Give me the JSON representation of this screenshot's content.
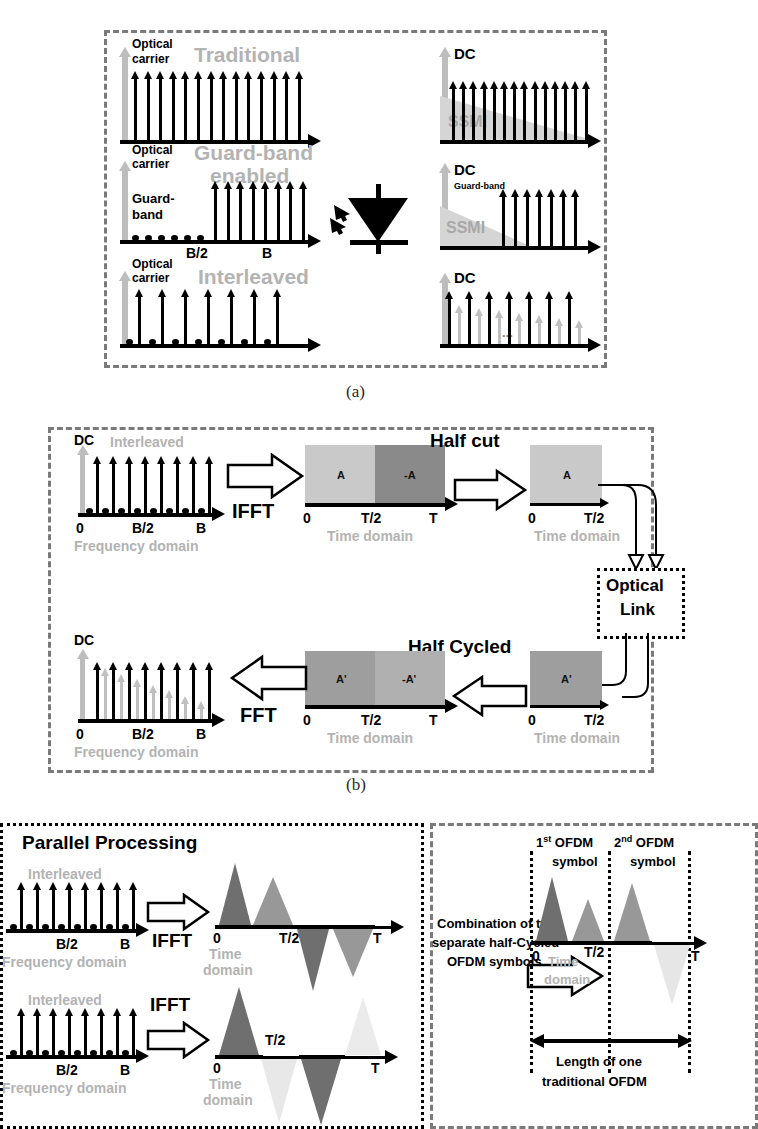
{
  "figure": {
    "captions": {
      "a": "(a)",
      "b": "(b)"
    }
  },
  "panel_a": {
    "rows": [
      {
        "title": "Traditional",
        "left": {
          "carrier_label_line1": "Optical",
          "carrier_label_line2": "carrier",
          "tone_count": 14,
          "pattern": "uniform"
        },
        "right": {
          "dc_label": "DC",
          "ssmi_label": "SSMI",
          "tone_count": 14,
          "ssmi_shape": "triangular-decay"
        }
      },
      {
        "title_line1": "Guard-band",
        "title_line2": "enabled",
        "left": {
          "carrier_label_line1": "Optical",
          "carrier_label_line2": "carrier",
          "guard_label_line1": "Guard-",
          "guard_label_line2": "band",
          "tick_half": "B/2",
          "tick_full": "B",
          "tone_count": 8,
          "guard_dot_count": 6
        },
        "right": {
          "dc_label": "DC",
          "guard_label": "Guard-band",
          "ssmi_label": "SSMI",
          "tone_count": 7
        }
      },
      {
        "title": "Interleaved",
        "left": {
          "carrier_label_line1": "Optical",
          "carrier_label_line2": "carrier",
          "tone_count": 7,
          "dot_count": 7
        },
        "right": {
          "dc_label": "DC",
          "tone_count": 7,
          "faint_tone_count": 7,
          "ellipsis": "..."
        }
      }
    ],
    "device": {
      "name": "photodiode",
      "label": ""
    }
  },
  "panel_b": {
    "top": {
      "spectrum": {
        "dc_label": "DC",
        "type_label": "Interleaved",
        "tick_zero": "0",
        "tick_half": "B/2",
        "tick_full": "B",
        "domain_label": "Frequency domain",
        "tone_count": 8
      },
      "op1": "IFFT",
      "block_full": {
        "seg1": "A",
        "seg2": "-A",
        "tick_zero": "0",
        "tick_half": "T/2",
        "tick_full": "T",
        "domain_label": "Time domain"
      },
      "op2": "Half cut",
      "block_half": {
        "seg1": "A",
        "tick_zero": "0",
        "tick_half": "T/2",
        "domain_label": "Time domain"
      }
    },
    "optical_link": {
      "line1": "Optical",
      "line2": "Link"
    },
    "bottom": {
      "spectrum": {
        "dc_label": "DC",
        "tick_zero": "0",
        "tick_half": "B/2",
        "tick_full": "B",
        "domain_label": "Frequency domain",
        "tone_count": 8,
        "faint_tone_count": 7
      },
      "op1": "FFT",
      "block_full": {
        "seg1": "A'",
        "seg2": "-A'",
        "tick_zero": "0",
        "tick_half": "T/2",
        "tick_full": "T",
        "domain_label": "Time domain"
      },
      "op2": "Half Cycled",
      "block_half": {
        "seg1": "A'",
        "tick_zero": "0",
        "tick_half": "T/2",
        "domain_label": "Time domain"
      }
    }
  },
  "panel_c": {
    "title": "Parallel Processing",
    "row1": {
      "spectrum": {
        "type_label": "Interleaved",
        "tick_half": "B/2",
        "tick_full": "B",
        "domain_label": "Frequency domain",
        "tone_count": 8
      },
      "op": "IFFT",
      "wave": {
        "tick_zero": "0",
        "tick_half": "T/2",
        "tick_full": "T",
        "domain_line1": "Time",
        "domain_line2": "domain"
      }
    },
    "row2": {
      "spectrum": {
        "type_label": "Interleaved",
        "tick_half": "B/2",
        "tick_full": "B",
        "domain_label": "Frequency domain",
        "tone_count": 8
      },
      "op": "IFFT",
      "wave": {
        "tick_zero": "0",
        "tick_half": "T/2",
        "tick_full": "T",
        "domain_line1": "Time",
        "domain_line2": "domain"
      }
    },
    "combiner": {
      "line1": "Combination of two",
      "line2": "separate half-Cycled",
      "line3": "OFDM symbols"
    },
    "result": {
      "sym1_line1": "1st OFDM",
      "sym1_line2": "symbol",
      "sym1_sup": "st",
      "sym1_pre": "1",
      "sym2_pre": "2",
      "sym2_sup": "nd",
      "sym2_line1": "2nd OFDM",
      "sym2_line2": "symbol",
      "tick_zero": "0",
      "tick_half": "T/2",
      "tick_full": "T",
      "domain_line1": "Time",
      "domain_line2": "domain",
      "length_line1": "Length of one",
      "length_line2": "traditional OFDM"
    }
  },
  "colors": {
    "dashed_border": "#7a7a7a",
    "gray_text": "#b3b3b3",
    "block_light": "#c9c9c9",
    "block_dark": "#8a8a8a",
    "block_mid": "#9e9e9e",
    "faint": "#e2e2e2"
  }
}
